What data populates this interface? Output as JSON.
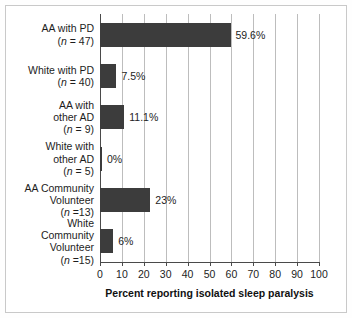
{
  "chart_data": {
    "type": "bar",
    "orientation": "horizontal",
    "title": "",
    "xlabel": "Percent reporting isolated sleep paralysis",
    "ylabel": "",
    "xlim": [
      0,
      100
    ],
    "xticks": [
      0,
      10,
      20,
      30,
      40,
      50,
      60,
      70,
      80,
      90,
      100
    ],
    "grid": "vertical",
    "legend": "none",
    "bar_color": "#3c3c3c",
    "grid_color": "#bdbdbd",
    "axis_color": "#4a4a4a",
    "categories": [
      "AA with PD (n = 47)",
      "White with PD (n = 40)",
      "AA with other AD (n = 9)",
      "White with other AD (n = 5)",
      "AA Community Volunteer (n =13)",
      "White Community Volunteer (n =15)"
    ],
    "values": [
      59.6,
      7.5,
      11.1,
      0,
      23,
      6
    ],
    "data_labels": [
      "59.6%",
      "7.5%",
      "11.1%",
      "0%",
      "23%",
      "6%"
    ]
  },
  "categories": [
    {
      "lines": [
        "AA with PD"
      ],
      "n_prefix": "(",
      "n_symbol": "n",
      "n_rest": " = 47)",
      "value": 59.6,
      "label": "59.6%"
    },
    {
      "lines": [
        "White with PD"
      ],
      "n_prefix": "(",
      "n_symbol": "n",
      "n_rest": " = 40)",
      "value": 7.5,
      "label": "7.5%"
    },
    {
      "lines": [
        "AA with",
        "other AD"
      ],
      "n_prefix": "(",
      "n_symbol": "n",
      "n_rest": " = 9)",
      "value": 11.1,
      "label": "11.1%"
    },
    {
      "lines": [
        "White with",
        "other AD"
      ],
      "n_prefix": "(",
      "n_symbol": "n",
      "n_rest": " = 5)",
      "value": 0,
      "label": "0%"
    },
    {
      "lines": [
        "AA Community",
        "Volunteer"
      ],
      "n_prefix": "(",
      "n_symbol": "n",
      "n_rest": " =13)",
      "value": 23,
      "label": "23%"
    },
    {
      "lines": [
        "White",
        "Community",
        "Volunteer"
      ],
      "n_prefix": "(",
      "n_symbol": "n",
      "n_rest": " =15)",
      "value": 6,
      "label": "6%"
    }
  ],
  "axis": {
    "title": "Percent reporting isolated sleep paralysis",
    "ticks": [
      "0",
      "10",
      "20",
      "30",
      "40",
      "50",
      "60",
      "70",
      "80",
      "90",
      "100"
    ]
  }
}
